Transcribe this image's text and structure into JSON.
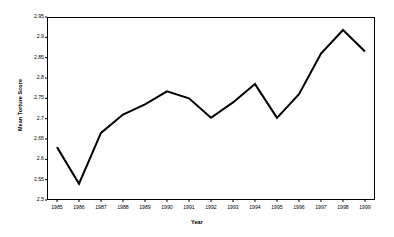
{
  "chart_data": {
    "type": "line",
    "title": "",
    "xlabel": "Year",
    "ylabel": "Mean Torture Score",
    "categories": [
      "1985",
      "1986",
      "1987",
      "1988",
      "1989",
      "1990",
      "1991",
      "1992",
      "1993",
      "1994",
      "1995",
      "1996",
      "1997",
      "1998",
      "1999"
    ],
    "values": [
      2.63,
      2.54,
      2.665,
      2.71,
      2.735,
      2.767,
      2.75,
      2.702,
      2.74,
      2.785,
      2.702,
      2.76,
      2.86,
      2.918,
      2.865
    ],
    "series": [
      {
        "name": "Mean Torture Score",
        "values": [
          2.63,
          2.54,
          2.665,
          2.71,
          2.735,
          2.767,
          2.75,
          2.702,
          2.74,
          2.785,
          2.702,
          2.76,
          2.86,
          2.918,
          2.865
        ]
      }
    ],
    "ylim": [
      2.5,
      2.95
    ],
    "ytick_labels": [
      "2.95",
      "2.9",
      "2.85",
      "2.8",
      "2.75",
      "2.7",
      "2.65",
      "2.6",
      "2.55",
      "2.5"
    ],
    "ytick_values": [
      2.95,
      2.9,
      2.85,
      2.8,
      2.75,
      2.7,
      2.65,
      2.6,
      2.55,
      2.5
    ],
    "xtick_labels": [
      "1985",
      "1986",
      "1987",
      "1988",
      "1989",
      "1990",
      "1991",
      "1992",
      "1993",
      "1994",
      "1995",
      "1996",
      "1997",
      "1998",
      "1999"
    ],
    "grid": false,
    "legend": "none",
    "line_color": "#000000",
    "line_width": 2,
    "axis_color": "#000000",
    "background_color": "#ffffff"
  }
}
